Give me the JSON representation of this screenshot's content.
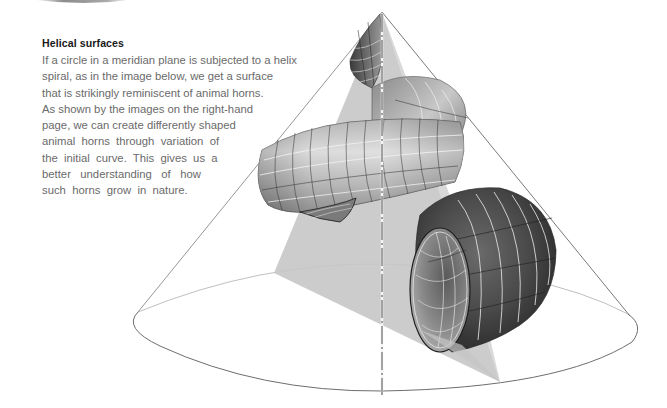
{
  "section": {
    "title": "Helical surfaces",
    "body_lines": [
      "If a circle in a meridian plane is subjected to a helix",
      "spiral, as in the image below, we get a surface",
      "that is strikingly reminiscent of animal horns.",
      "As shown by the images on the right-hand",
      "page, we can create differently shaped",
      "animal  horns  through  variation  of",
      "the  initial  curve.  This  gives  us  a",
      "better   understanding   of   how",
      "such  horns  grow  in  nature."
    ]
  },
  "figure": {
    "colors": {
      "cone_edge": "#8a8a8a",
      "meridian_plane": "#c4c4c4",
      "surface_dark": "#3c3c3c",
      "surface_light": "#d8d8d8",
      "grid_line": "#f2f2f2",
      "axis": "#555555"
    }
  }
}
